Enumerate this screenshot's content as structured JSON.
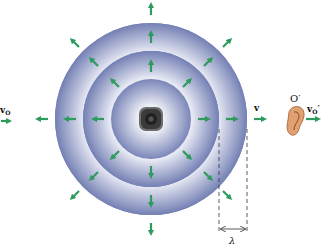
{
  "diagram": {
    "source": {
      "center": [
        151,
        119
      ],
      "icon": "speaker-icon"
    },
    "wavefronts": [
      {
        "name": "outer",
        "radius": 96
      },
      {
        "name": "middle",
        "radius": 68
      },
      {
        "name": "inner",
        "radius": 40
      }
    ],
    "colors": {
      "wave_fill": "#7b86b8",
      "wave_light": "#e6e8f3",
      "arrow": "#2e9a5e",
      "text": "#111111"
    },
    "labels": {
      "observer_left_velocity": "v",
      "observer_left_sub": "O",
      "wave_velocity": "v",
      "observer_right": "O′",
      "observer_right_velocity": "v",
      "observer_right_sub": "O",
      "observer_right_prime": "′",
      "wavelength": "λ"
    },
    "observer_right_icon": "ear-icon"
  }
}
